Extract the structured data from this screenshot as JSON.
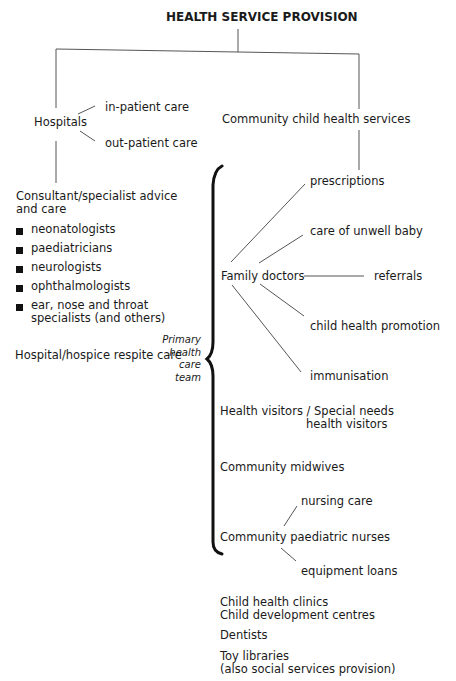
{
  "diagram": {
    "title": "HEALTH SERVICE PROVISION",
    "hospitals": {
      "label": "Hospitals",
      "branches": [
        "in-patient care",
        "out-patient care"
      ],
      "consultant": {
        "line1": "Consultant/specialist advice",
        "line2": "and care",
        "specialists": [
          "neonatologists",
          "paediatricians",
          "neurologists",
          "ophthalmologists",
          "ear, nose and throat",
          "specialists (and others)"
        ]
      },
      "respite": "Hospital/hospice respite care"
    },
    "community": {
      "label": "Community child health services",
      "primary_team_label": [
        "Primary",
        "health",
        "care",
        "team"
      ],
      "family_doctors": {
        "label": "Family doctors",
        "services": [
          "prescriptions",
          "care of unwell baby",
          "referrals",
          "child health promotion",
          "immunisation"
        ]
      },
      "health_visitors": {
        "line1": "Health visitors / Special needs",
        "line2": "health visitors"
      },
      "midwives": "Community midwives",
      "nurses": {
        "label": "Community paediatric nurses",
        "services": [
          "nursing care",
          "equipment loans"
        ]
      },
      "other": {
        "clinics": "Child health clinics",
        "centres": "Child development centres",
        "dentists": "Dentists",
        "toy_line1": "Toy libraries",
        "toy_line2": "(also social services provision)"
      }
    }
  }
}
